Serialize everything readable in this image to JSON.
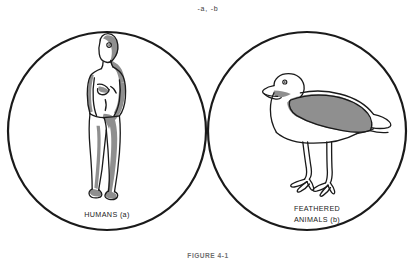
{
  "figure": {
    "type": "venn-diagram",
    "complement_label": "-a, -b",
    "caption": "FIGURE 4-1",
    "left_set_label": "HUMANS (a)",
    "right_set_label_line1": "FEATHERED",
    "right_set_label_line2": "ANIMALS (b)",
    "left_illustration": "human-figure",
    "right_illustration": "bird-figure",
    "intersection_state": "shaded",
    "colors": {
      "outline": "#1a1a1a",
      "shade": "#8c8c8c",
      "illustration_shade": "#8f8f8f",
      "background": "#ffffff",
      "text": "#1a1a1a"
    },
    "geometry": {
      "left_circle": {
        "cx": 107,
        "cy": 131,
        "r": 99
      },
      "right_circle": {
        "cx": 307,
        "cy": 131,
        "r": 99
      },
      "intersection_top": {
        "x": 207,
        "y": 56
      },
      "intersection_bottom": {
        "x": 207,
        "y": 206
      }
    }
  }
}
